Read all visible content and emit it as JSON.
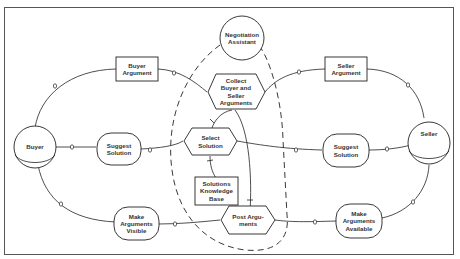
{
  "diagram": {
    "frame_color": "#555555",
    "line_color": "#222222",
    "nodes": {
      "negotiation_assistant": "Negotiation\nAssistant",
      "buyer_argument": "Buyer\nArgument",
      "seller_argument": "Seller\nArgument",
      "collect_arguments": "Collect\nBuyer and\nSeller\nArguments",
      "buyer": "Buyer",
      "seller": "Seller",
      "suggest_solution_buyer": "Suggest\nSolution",
      "select_solution": "Select\nSolution",
      "suggest_solution_seller": "Suggest\nSolution",
      "solutions_kb": "Solutions\nKnowledge\nBase",
      "make_arguments_visible": "Make\nArguments\nVisible",
      "post_arguments": "Post Argu-\nments",
      "make_arguments_available": "Make\nArguments\nAvailable"
    }
  }
}
